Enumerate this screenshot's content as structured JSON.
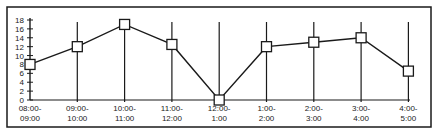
{
  "chart_data": {
    "type": "line",
    "title": "",
    "xlabel": "",
    "ylabel": "",
    "categories": [
      "08:00-09:00",
      "09:00-10:00",
      "10:00-11:00",
      "11:00-12:00",
      "12:00-1:00",
      "1:00-2:00",
      "2:00-3:00",
      "3:00-4:00",
      "4:00-5:00"
    ],
    "category_lines": [
      [
        "08:00-",
        "09:00"
      ],
      [
        "09:00-",
        "10:00"
      ],
      [
        "10:00-",
        "11:00"
      ],
      [
        "11:00-",
        "12:00"
      ],
      [
        "12:00-",
        "1:00"
      ],
      [
        "1:00-",
        "2:00"
      ],
      [
        "2:00-",
        "3:00"
      ],
      [
        "3:00-",
        "4:00"
      ],
      [
        "4:00-",
        "5:00"
      ]
    ],
    "series": [
      {
        "name": "series-1",
        "marker": "square",
        "values": [
          8,
          12,
          17,
          12.5,
          0,
          12,
          13,
          14,
          6.5
        ]
      }
    ],
    "yticks": [
      0,
      2,
      4,
      6,
      8,
      10,
      12,
      14,
      16,
      18
    ],
    "ylim": [
      0,
      18
    ],
    "grid": "vertical lines at each category",
    "legend": null,
    "colors": {
      "line": "#1a1a1a",
      "marker_fill": "#ffffff",
      "frame": "#1a1a1a"
    }
  },
  "caption": {
    "text": ""
  }
}
